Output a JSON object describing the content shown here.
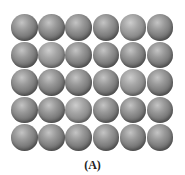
{
  "figure": {
    "caption": "(A)",
    "grid": {
      "columns": 6,
      "rows": 5,
      "sphere_color": "#7a7a7a",
      "highlight_color": "#c4c4c4",
      "background": "#ffffff"
    }
  }
}
